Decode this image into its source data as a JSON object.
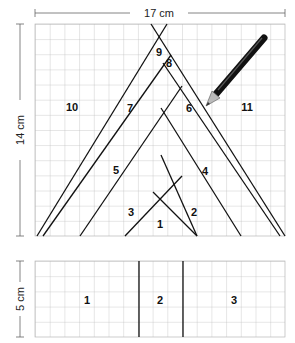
{
  "top_figure": {
    "width_label": "17 cm",
    "height_label": "14 cm",
    "regions": [
      {
        "id": "1",
        "label": "1",
        "x": 160,
        "y": 228
      },
      {
        "id": "2",
        "label": "2",
        "x": 194,
        "y": 216
      },
      {
        "id": "3",
        "label": "3",
        "x": 131,
        "y": 216
      },
      {
        "id": "4",
        "label": "4",
        "x": 205,
        "y": 175
      },
      {
        "id": "5",
        "label": "5",
        "x": 116,
        "y": 174
      },
      {
        "id": "6",
        "label": "6",
        "x": 189,
        "y": 112
      },
      {
        "id": "7",
        "label": "7",
        "x": 130,
        "y": 112
      },
      {
        "id": "8",
        "label": "8",
        "x": 169,
        "y": 67
      },
      {
        "id": "9",
        "label": "9",
        "x": 159,
        "y": 56
      },
      {
        "id": "10",
        "label": "10",
        "x": 72,
        "y": 111
      },
      {
        "id": "11",
        "label": "11",
        "x": 247,
        "y": 111
      }
    ]
  },
  "bottom_figure": {
    "height_label": "5 cm",
    "regions": [
      {
        "id": "1",
        "label": "1"
      },
      {
        "id": "2",
        "label": "2"
      },
      {
        "id": "3",
        "label": "3"
      }
    ]
  },
  "pencil": {
    "icon": "pencil-icon"
  }
}
